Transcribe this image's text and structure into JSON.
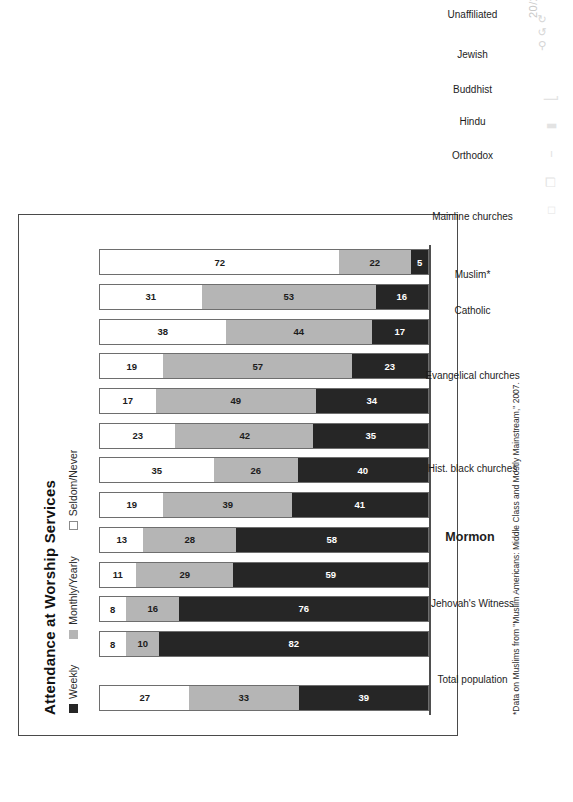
{
  "viewer": {
    "page_indicator": "20/26",
    "icons": [
      "rotate-ccw-icon",
      "rotate-cw-icon",
      "zoom-out-icon"
    ],
    "toolbar_icons": [
      "signature-icon",
      "stamp-icon",
      "text-icon",
      "copy-icon",
      "rectangle-icon"
    ]
  },
  "chart_data": {
    "type": "bar",
    "subtype": "stacked-horizontal-100",
    "title": "Attendance at Worship Services",
    "xlabel": "",
    "ylabel": "",
    "grid": false,
    "legend_position": "top-left",
    "orientation": "page-rotated-90",
    "highlight_category": "Mormon",
    "categories": [
      "Total population",
      "Jehovah's Witness",
      "Mormon",
      "Hist. black churches",
      "Evangelical churches",
      "Catholic",
      "Muslim*",
      "Mainline churches",
      "Orthodox",
      "Hindu",
      "Buddhist",
      "Jewish",
      "Unaffiliated"
    ],
    "series": [
      {
        "name": "Weekly",
        "color": "#262626",
        "values": [
          39,
          82,
          76,
          59,
          58,
          41,
          40,
          35,
          34,
          23,
          17,
          16,
          5
        ]
      },
      {
        "name": "Monthly/Yearly",
        "color": "#b5b5b5",
        "values": [
          33,
          10,
          16,
          29,
          28,
          39,
          26,
          42,
          49,
          57,
          44,
          53,
          22
        ]
      },
      {
        "name": "Seldom/Never",
        "color": "#ffffff",
        "values": [
          27,
          8,
          8,
          11,
          13,
          19,
          35,
          23,
          17,
          19,
          38,
          31,
          72
        ]
      }
    ],
    "footnote": "*Data on Muslims from \"Muslim Americans: Middle Class and Mostly Mainstream,\" 2007."
  }
}
